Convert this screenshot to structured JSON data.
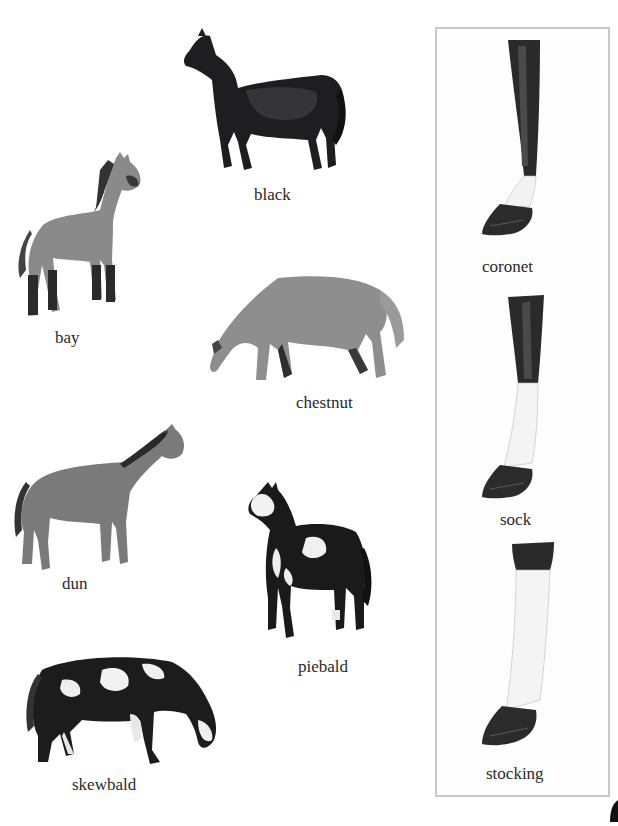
{
  "page": {
    "background": "#ffffff"
  },
  "coat_colors": {
    "black": {
      "label": "black"
    },
    "bay": {
      "label": "bay"
    },
    "chestnut": {
      "label": "chestnut"
    },
    "dun": {
      "label": "dun"
    },
    "piebald": {
      "label": "piebald"
    },
    "skewbald": {
      "label": "skewbald"
    }
  },
  "leg_markings_panel": {
    "border_color": "#c8c8c8",
    "items": [
      {
        "label": "coronet"
      },
      {
        "label": "sock"
      },
      {
        "label": "stocking"
      }
    ]
  }
}
